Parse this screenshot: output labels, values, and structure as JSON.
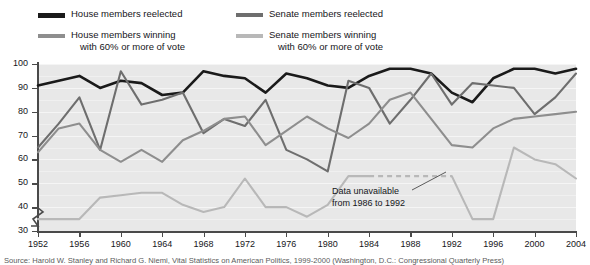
{
  "legend": {
    "items": [
      {
        "label_line1": "House members reelected",
        "label_line2": "",
        "color": "#1a1a1a",
        "key": "house-reelected"
      },
      {
        "label_line1": "Senate members reelected",
        "label_line2": "",
        "color": "#6e6e6e",
        "key": "senate-reelected"
      },
      {
        "label_line1": "House members winning",
        "label_line2": "with 60% or more of vote",
        "color": "#8e8e8e",
        "key": "house-60"
      },
      {
        "label_line1": "Senate members winning",
        "label_line2": "with 60% or more of vote",
        "color": "#b8b8b8",
        "key": "senate-60"
      }
    ]
  },
  "annotation": {
    "line1": "Data unavailable",
    "line2": "from 1986 to 1992"
  },
  "source": {
    "text": "Source: Harold W. Stanley and Richard G. Niemi, Vital Statistics on American Politics, 1999-2000 (Washington, D.C.: Congressional Quarterly Press)"
  },
  "chart_data": {
    "type": "line",
    "title": "",
    "xlabel": "",
    "ylabel": "Percentage",
    "ylim": [
      30,
      100
    ],
    "xlim": [
      1952,
      2004
    ],
    "grid": true,
    "legend_position": "above-plot",
    "y_ticks": [
      100,
      90,
      80,
      70,
      60,
      50,
      40,
      30
    ],
    "x_ticks": [
      1952,
      1956,
      1960,
      1964,
      1968,
      1972,
      1976,
      1980,
      1984,
      1988,
      1992,
      1996,
      2000,
      2004
    ],
    "axis_break": true,
    "x": [
      1952,
      1954,
      1956,
      1958,
      1960,
      1962,
      1964,
      1966,
      1968,
      1970,
      1972,
      1974,
      1976,
      1978,
      1980,
      1982,
      1984,
      1986,
      1988,
      1990,
      1992,
      1994,
      1996,
      1998,
      2000,
      2002,
      2004
    ],
    "series": [
      {
        "name": "House members reelected",
        "color": "#1a1a1a",
        "values": [
          91,
          93,
          95,
          90,
          93,
          92,
          87,
          88,
          97,
          95,
          94,
          88,
          96,
          94,
          91,
          90,
          95,
          98,
          98,
          96,
          88,
          84,
          94,
          98,
          98,
          96,
          98
        ]
      },
      {
        "name": "Senate members reelected",
        "color": "#6e6e6e",
        "values": [
          65,
          75,
          86,
          64,
          97,
          83,
          85,
          88,
          71,
          77,
          74,
          85,
          64,
          60,
          55,
          93,
          90,
          75,
          85,
          96,
          83,
          92,
          91,
          90,
          79,
          86,
          96
        ]
      },
      {
        "name": "House members winning with 60% or more of vote",
        "color": "#8e8e8e",
        "values": [
          63,
          73,
          75,
          64,
          59,
          64,
          59,
          68,
          72,
          77,
          78,
          66,
          72,
          78,
          73,
          69,
          75,
          85,
          88,
          77,
          66,
          65,
          73,
          77,
          78,
          79,
          80
        ]
      },
      {
        "name": "Senate members winning with 60% or more of vote",
        "color": "#b8b8b8",
        "values": [
          35,
          35,
          35,
          44,
          45,
          46,
          46,
          41,
          38,
          40,
          52,
          40,
          40,
          36,
          41,
          53,
          53,
          null,
          null,
          null,
          53,
          35,
          35,
          65,
          60,
          58,
          52
        ]
      }
    ],
    "dashed_gap": {
      "series": "Senate members winning with 60% or more of vote",
      "from_year": 1986,
      "to_year": 1992
    }
  }
}
